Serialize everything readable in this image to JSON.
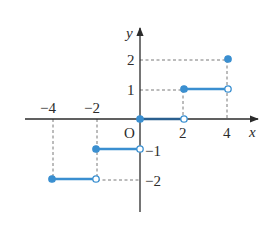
{
  "chart_data": {
    "type": "line",
    "title": "",
    "xlabel": "x",
    "ylabel": "y",
    "origin_label": "O",
    "x_ticks": [
      "-4",
      "-2",
      "2",
      "4"
    ],
    "y_ticks": [
      "2",
      "1",
      "-1",
      "-2"
    ],
    "xlim": [
      -5,
      5.3
    ],
    "ylim": [
      -2.9,
      3
    ],
    "grid": false,
    "segments": [
      {
        "x_start": -4,
        "x_end": -2,
        "y": -2,
        "start_closed": true,
        "end_closed": false
      },
      {
        "x_start": -2,
        "x_end": 0,
        "y": -1,
        "start_closed": true,
        "end_closed": false
      },
      {
        "x_start": 0,
        "x_end": 2,
        "y": 0,
        "start_closed": true,
        "end_closed": false
      },
      {
        "x_start": 2,
        "x_end": 4,
        "y": 1,
        "start_closed": true,
        "end_closed": false
      }
    ],
    "isolated_points": [
      {
        "x": 4,
        "y": 2,
        "closed": true
      }
    ],
    "colors": {
      "series": "#3a8fd0",
      "axis": "#2b2b2b",
      "guides": "#555555"
    }
  }
}
